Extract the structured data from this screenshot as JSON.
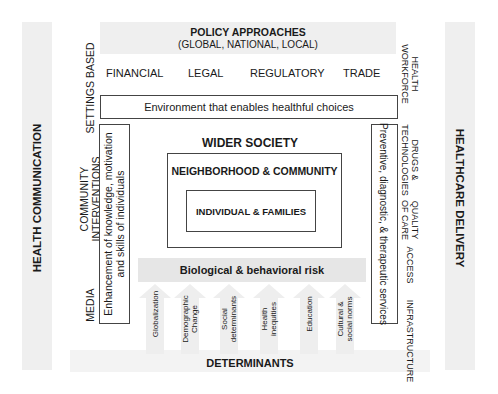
{
  "policy": {
    "title": "POLICY APPROACHES",
    "subtitle": "(GLOBAL, NATIONAL, LOCAL)",
    "items": [
      "FINANCIAL",
      "LEGAL",
      "REGULATORY",
      "TRADE"
    ]
  },
  "environment_box": "Environment that enables healthful choices",
  "left": {
    "outer_label": "HEALTH COMMUNICATION",
    "items": [
      "SETTINGS BASED",
      "COMMUNITY\nINTERVENTIONS",
      "MEDIA"
    ],
    "items_split": {
      "settings": "SETTINGS BASED",
      "community_1": "COMMUNITY",
      "community_2": "INTERVENTIONS",
      "media": "MEDIA"
    },
    "box_line1": "Enhancement of knowledge, motivation",
    "box_line2": "and skills of individuals"
  },
  "right": {
    "outer_label": "HEALTHCARE DELIVERY",
    "items_split": {
      "workforce_1": "HEALTH",
      "workforce_2": "WORKFORCE",
      "drugs_1": "DRUGS &",
      "drugs_2": "TECHNOLOGIES",
      "quality_1": "QUALITY",
      "quality_2": "OF CARE",
      "access": "ACCESS",
      "infrastructure": "INFRASTRUCTURE"
    },
    "box_text": "Preventive, diagnostic, & therapeutic services"
  },
  "center": {
    "wider_society": "WIDER SOCIETY",
    "neighborhood": "NEIGHBORHOOD & COMMUNITY",
    "individual": "INDIVIDUAL & FAMILIES",
    "risk": "Biological & behavioral risk"
  },
  "determinants": {
    "title": "DETERMINANTS",
    "arrows": [
      {
        "line1": "Globalization",
        "line2": ""
      },
      {
        "line1": "Demographic",
        "line2": "Change"
      },
      {
        "line1": "Social",
        "line2": "determinants"
      },
      {
        "line1": "Health",
        "line2": "inequities"
      },
      {
        "line1": "Education",
        "line2": ""
      },
      {
        "line1": "Cultural &",
        "line2": "social norms"
      }
    ]
  }
}
